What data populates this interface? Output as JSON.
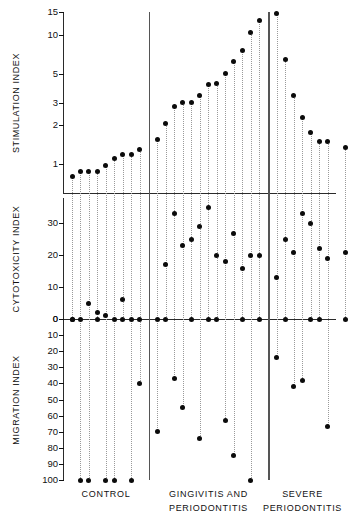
{
  "chart_data": {
    "type": "scatter",
    "title": "",
    "subtitle": "",
    "panels": [
      {
        "id": "stimulation",
        "ylabel": "STIMULATION INDEX",
        "scale": "log",
        "ticks": [
          1,
          2,
          3,
          5,
          10,
          15
        ],
        "tick_labels": [
          "1",
          "2",
          "3",
          "5",
          "10",
          "15"
        ],
        "ylim": [
          0.6,
          15
        ],
        "baseline": 0.62
      },
      {
        "id": "cytotoxicity",
        "ylabel": "CYTOTOXICITY INDEX",
        "scale": "linear",
        "ticks": [
          0,
          10,
          20,
          30
        ],
        "tick_labels": [
          "0",
          "10",
          "20",
          "30"
        ],
        "ylim": [
          0,
          38
        ],
        "baseline": 0
      },
      {
        "id": "migration",
        "ylabel": "MIGRATION INDEX",
        "scale": "linear-inverted",
        "ticks": [
          0,
          10,
          20,
          30,
          40,
          50,
          60,
          70,
          80,
          90,
          100
        ],
        "tick_labels": [
          "0",
          "10",
          "20",
          "30",
          "40",
          "50",
          "60",
          "70",
          "80",
          "90",
          "100"
        ],
        "ylim": [
          0,
          100
        ],
        "baseline": 0
      }
    ],
    "groups": [
      {
        "name": "CONTROL",
        "label_lines": [
          "CONTROL"
        ],
        "n": 9
      },
      {
        "name": "GINGIVITIS AND PERIODONTITIS",
        "label_lines": [
          "GINGIVITIS  AND",
          "PERIODONTITIS"
        ],
        "n": 13
      },
      {
        "name": "SEVERE PERIODONTITIS",
        "label_lines": [
          "SEVERE",
          "PERIODONTITIS"
        ],
        "n": 7
      }
    ],
    "xlabel": "",
    "grid": false,
    "legend": "none",
    "subjects": [
      {
        "group": 0,
        "stimulation": 0.8,
        "cytotoxicity": 0,
        "migration": 0
      },
      {
        "group": 0,
        "stimulation": 0.88,
        "cytotoxicity": 0,
        "migration": 100
      },
      {
        "group": 0,
        "stimulation": 0.88,
        "cytotoxicity": 5,
        "migration": 100
      },
      {
        "group": 0,
        "stimulation": 0.88,
        "cytotoxicity": 2,
        "migration": 0
      },
      {
        "group": 0,
        "stimulation": 0.97,
        "cytotoxicity": 1,
        "migration": 100
      },
      {
        "group": 0,
        "stimulation": 1.1,
        "cytotoxicity": 0,
        "migration": 100
      },
      {
        "group": 0,
        "stimulation": 1.2,
        "cytotoxicity": 6,
        "migration": 0
      },
      {
        "group": 0,
        "stimulation": 1.2,
        "cytotoxicity": 0,
        "migration": 100
      },
      {
        "group": 0,
        "stimulation": 1.3,
        "cytotoxicity": 0,
        "migration": 40
      },
      {
        "group": 1,
        "stimulation": 1.55,
        "cytotoxicity": 0,
        "migration": 70
      },
      {
        "group": 1,
        "stimulation": 2.05,
        "cytotoxicity": 17,
        "migration": 0
      },
      {
        "group": 1,
        "stimulation": 2.8,
        "cytotoxicity": 33,
        "migration": 37
      },
      {
        "group": 1,
        "stimulation": 3.0,
        "cytotoxicity": 23,
        "migration": 55
      },
      {
        "group": 1,
        "stimulation": 3.0,
        "cytotoxicity": 25,
        "migration": 0
      },
      {
        "group": 1,
        "stimulation": 3.4,
        "cytotoxicity": 29,
        "migration": 74
      },
      {
        "group": 1,
        "stimulation": 4.1,
        "cytotoxicity": 35,
        "migration": 0
      },
      {
        "group": 1,
        "stimulation": 4.2,
        "cytotoxicity": 20,
        "migration": 0
      },
      {
        "group": 1,
        "stimulation": 5.0,
        "cytotoxicity": 18,
        "migration": 63
      },
      {
        "group": 1,
        "stimulation": 6.2,
        "cytotoxicity": 27,
        "migration": 85
      },
      {
        "group": 1,
        "stimulation": 7.5,
        "cytotoxicity": 16,
        "migration": 0
      },
      {
        "group": 1,
        "stimulation": 10.5,
        "cytotoxicity": 20,
        "migration": 100
      },
      {
        "group": 1,
        "stimulation": 13.0,
        "cytotoxicity": 20,
        "migration": 0
      },
      {
        "group": 1,
        "stimulation": 14.5,
        "cytotoxicity": 13,
        "migration": 24
      },
      {
        "group": 2,
        "stimulation": 6.5,
        "cytotoxicity": 25,
        "migration": 0
      },
      {
        "group": 2,
        "stimulation": 3.4,
        "cytotoxicity": 21,
        "migration": 42
      },
      {
        "group": 2,
        "stimulation": 2.3,
        "cytotoxicity": 33,
        "migration": 38
      },
      {
        "group": 2,
        "stimulation": 1.75,
        "cytotoxicity": 30,
        "migration": 0
      },
      {
        "group": 2,
        "stimulation": 1.5,
        "cytotoxicity": 22,
        "migration": 0
      },
      {
        "group": 2,
        "stimulation": 1.5,
        "cytotoxicity": 19,
        "migration": 67
      },
      {
        "group": 2,
        "stimulation": 1.35,
        "cytotoxicity": 21,
        "migration": 0
      }
    ]
  }
}
